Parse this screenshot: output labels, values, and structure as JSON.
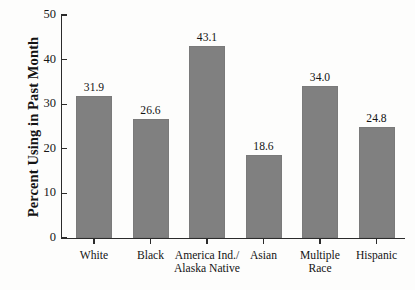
{
  "chart_data": {
    "type": "bar",
    "title": "",
    "xlabel": "",
    "ylabel": "Percent Using in Past Month",
    "categories": [
      "White",
      "Black",
      "America Ind./\nAlaska Native",
      "Asian",
      "Multiple\nRace",
      "Hispanic"
    ],
    "values": [
      31.9,
      26.6,
      43.1,
      18.6,
      34.0,
      24.8
    ],
    "value_labels": [
      "31.9",
      "26.6",
      "43.1",
      "18.6",
      "34.0",
      "24.8"
    ],
    "ylim": [
      0,
      50
    ],
    "ytick_values": [
      0,
      10,
      20,
      30,
      40,
      50
    ],
    "ytick_labels": [
      "0",
      "10",
      "20",
      "30",
      "40",
      "50"
    ],
    "grid": false,
    "legend": "none",
    "bar_color": "#808080",
    "axis_color": "#2b2b2b",
    "background_color": "#fdfdfc",
    "text_color": "#141414"
  }
}
